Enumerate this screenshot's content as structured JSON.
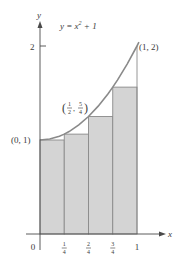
{
  "chart_data": {
    "type": "area",
    "function": "y = x^2 + 1",
    "xlabel": "x",
    "ylabel": "y",
    "xlim": [
      0,
      1
    ],
    "ylim": [
      0,
      2
    ],
    "x_ticks": [
      {
        "value": 0,
        "label": "0"
      },
      {
        "value": 0.25,
        "label": "1/4"
      },
      {
        "value": 0.5,
        "label": "2/4"
      },
      {
        "value": 0.75,
        "label": "3/4"
      },
      {
        "value": 1,
        "label": "1"
      }
    ],
    "y_ticks": [
      {
        "value": 2,
        "label": "2"
      }
    ],
    "rectangles": {
      "method": "left endpoint (lower sum)",
      "n": 4,
      "x_left": [
        0,
        0.25,
        0.5,
        0.75
      ],
      "width": 0.25,
      "heights": [
        1,
        1.0625,
        1.25,
        1.5625
      ]
    },
    "curve_points": {
      "x": [
        0,
        0.1,
        0.2,
        0.25,
        0.3,
        0.4,
        0.5,
        0.6,
        0.7,
        0.75,
        0.8,
        0.9,
        1.0,
        1.02
      ],
      "y": [
        1,
        1.01,
        1.04,
        1.0625,
        1.09,
        1.16,
        1.25,
        1.36,
        1.49,
        1.5625,
        1.64,
        1.81,
        2.0,
        2.04
      ]
    },
    "annotations": [
      {
        "text": "(0, 1)",
        "x": 0,
        "y": 1
      },
      {
        "text": "(1/2, 5/4)",
        "num1": "1",
        "den1": "2",
        "num2": "5",
        "den2": "4",
        "x": 0.5,
        "y": 1.25
      },
      {
        "text": "(1, 2)",
        "x": 1,
        "y": 2
      }
    ],
    "colors": {
      "fill": "#d4d4d4",
      "stroke": "#8a8a8a",
      "curve": "#8a8a8a",
      "axis": "#4a4a4a",
      "text": "#3a3a3a"
    },
    "grid": false,
    "legend": null
  }
}
